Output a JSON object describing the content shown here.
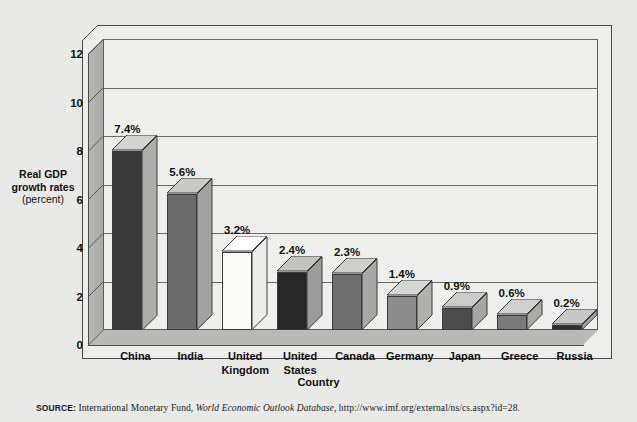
{
  "chart_data": {
    "type": "bar",
    "title": "",
    "xlabel": "Country",
    "ylabel": "Real GDP growth rates",
    "ylabel_unit": "(percent)",
    "ylim": [
      0,
      12
    ],
    "yticks": [
      0,
      2,
      4,
      6,
      8,
      10,
      12
    ],
    "grid": true,
    "legend": "none",
    "categories": [
      "China",
      "India",
      "United\nKingdom",
      "United\nStates",
      "Canada",
      "Germany",
      "Japan",
      "Greece",
      "Russia"
    ],
    "values": [
      7.4,
      5.6,
      3.2,
      2.4,
      2.3,
      1.4,
      0.9,
      0.6,
      0.2
    ],
    "data_labels": [
      "7.4%",
      "5.6%",
      "3.2%",
      "2.4%",
      "2.3%",
      "1.4%",
      "0.9%",
      "0.6%",
      "0.2%"
    ],
    "bar_colors": [
      "#39393a",
      "#6b6b6c",
      "#fbfbf9",
      "#262627",
      "#6f6f70",
      "#8d8d8e",
      "#4b4b4c",
      "#7a7a7b",
      "#2e2e2f"
    ],
    "bar_top_colors": [
      "#d3d3d1",
      "#c9c9c7",
      "#ffffff",
      "#c3c3c1",
      "#cfcfcd",
      "#d6d6d4",
      "#cbcbc9",
      "#d0d0ce",
      "#c8c8c6"
    ],
    "bar_side_colors": [
      "#adadac",
      "#a2a2a1",
      "#ececea",
      "#9c9c9b",
      "#a8a8a7",
      "#b1b1b0",
      "#a5a5a4",
      "#aaaaa9",
      "#a0a09f"
    ]
  },
  "source": {
    "label": "SOURCE:",
    "text_before": " International Monetary Fund, ",
    "italic": "World Economic Outlook Database",
    "text_after": ", http://www.imf.org/external/ns/cs.aspx?id=28."
  },
  "colors": {
    "page_background": "#e9e9e7",
    "plot_background": "#efefed",
    "axis": "#4a4a4a",
    "grid": "#6a6a6a",
    "floor": "#b9b9b7",
    "sidewall": "#b0b0ae",
    "text": "#111111"
  }
}
